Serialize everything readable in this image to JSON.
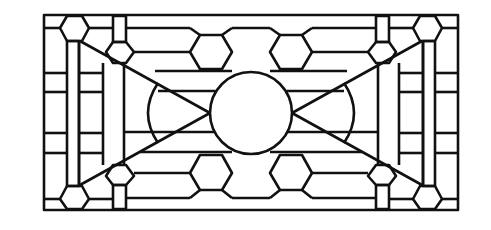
{
  "figure": {
    "stroke_color": "#111111",
    "background": "#ffffff"
  }
}
